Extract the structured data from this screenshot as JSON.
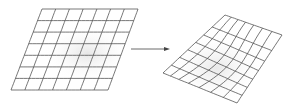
{
  "diagram": {
    "source_grid": {
      "rows": 7,
      "cols": 7
    },
    "target_grid": {
      "rows": 7,
      "cols": 7,
      "warped": true
    },
    "colors": {
      "line": "#555555",
      "shade": "#ececec",
      "background": "#ffffff"
    }
  }
}
